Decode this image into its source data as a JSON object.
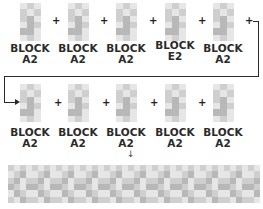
{
  "diagram": {
    "type": "block-sequence",
    "row1": [
      {
        "line1": "BLOCK",
        "line2": "A2"
      },
      {
        "line1": "BLOCK",
        "line2": "A2"
      },
      {
        "line1": "BLOCK",
        "line2": "A2"
      },
      {
        "line1": "BLOCK",
        "line2": "E2"
      },
      {
        "line1": "BLOCK",
        "line2": "A2"
      }
    ],
    "row2": [
      {
        "line1": "BLOCK",
        "line2": "A2"
      },
      {
        "line1": "BLOCK",
        "line2": "A2"
      },
      {
        "line1": "BLOCK",
        "line2": "A2"
      },
      {
        "line1": "BLOCK",
        "line2": "A2"
      },
      {
        "line1": "BLOCK",
        "line2": "A2"
      }
    ],
    "operator": "+",
    "down_arrow": "↓",
    "result": "combined-pattern-strip",
    "colors": {
      "light": "#e6e6e6",
      "mid": "#cfcfcf",
      "dark": "#b8b8b8",
      "text": "#2a2a2a"
    }
  }
}
